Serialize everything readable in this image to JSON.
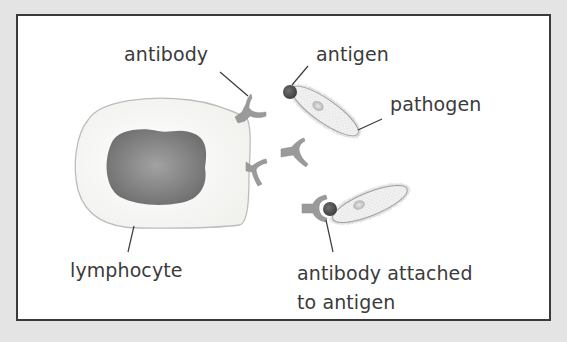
{
  "diagram": {
    "title": "",
    "labels": {
      "antibody": "antibody",
      "antigen": "antigen",
      "pathogen": "pathogen",
      "lymphocyte": "lymphocyte",
      "attached_line1": "antibody attached",
      "attached_line2": "to antigen"
    },
    "components": [
      {
        "id": "lymphocyte",
        "desc": "white blood cell with dark nucleus, producing Y-shaped antibodies"
      },
      {
        "id": "antibody",
        "count": 4,
        "desc": "Y-shaped proteins; two on cell surface, one free, one attached"
      },
      {
        "id": "pathogen",
        "count": 2,
        "desc": "elongated stippled cells with hair-like fringe"
      },
      {
        "id": "antigen",
        "count": 2,
        "desc": "dark circular marker on pathogen tip"
      }
    ],
    "colors": {
      "background": "#e4e4e4",
      "frame_border": "#3a3a3a",
      "frame_fill": "#ffffff",
      "cell_fill": "#f8f8f6",
      "cell_outline": "#bdbdbd",
      "nucleus": "#7c7c7c",
      "antibody": "#9a9a9a",
      "antigen": "#4f4f4f",
      "pathogen_fill": "#eeeeee",
      "text": "#3b3b3b",
      "leader_line": "#3b3b3b"
    }
  }
}
